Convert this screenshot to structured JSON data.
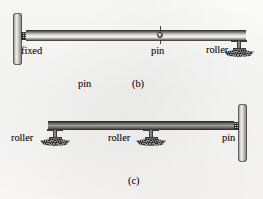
{
  "figure": {
    "background_color": "#faf9f8",
    "ink_color": "#1d1d1d"
  },
  "panels": [
    {
      "id": "b",
      "caption": "(b)",
      "beam_style": "light-steel",
      "labels": [
        {
          "name": "fixed-label",
          "text": "fixed",
          "x": 21,
          "y": 45
        },
        {
          "name": "pin-label",
          "text": "pin",
          "x": 151,
          "y": 45
        },
        {
          "name": "roller-label",
          "text": "roller",
          "x": 211,
          "y": 45
        }
      ],
      "stray_label": {
        "name": "stray-pin-label",
        "text": "pin",
        "x": 78,
        "y": 79
      }
    },
    {
      "id": "c",
      "caption": "(c)",
      "beam_style": "dark-steel",
      "labels": [
        {
          "name": "roller-left-label",
          "text": "roller",
          "x": 13,
          "y": 134
        },
        {
          "name": "roller-middle-label",
          "text": "roller",
          "x": 110,
          "y": 134
        },
        {
          "name": "pin-right-label",
          "text": "pin",
          "x": 223,
          "y": 134
        }
      ]
    }
  ],
  "captions": {
    "b": "(b)",
    "c": "(c)"
  },
  "supports": {
    "fixed": "fixed",
    "pin": "pin",
    "roller": "roller"
  },
  "colors": {
    "beam_light_top": "#585654",
    "beam_light_highlight": "#f6f5f2",
    "beam_dark": "#6e6d6a",
    "wall": "#b9b7b3",
    "ground_hatch": "#8d8b87",
    "ink": "#1d1d1d"
  }
}
